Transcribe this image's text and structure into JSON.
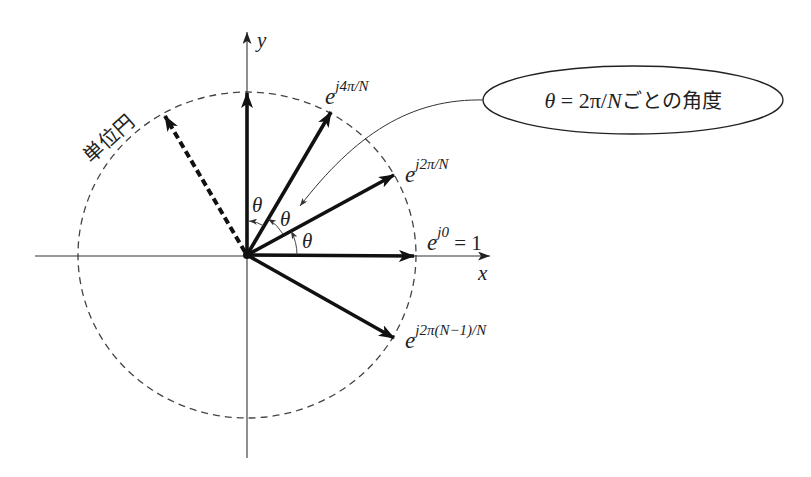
{
  "diagram": {
    "axes": {
      "x_label": "x",
      "y_label": "y"
    },
    "unit_circle_label": "単位円",
    "vectors": [
      {
        "name": "e-j0",
        "base": "e",
        "exponent": "j0",
        "suffix": " = 1",
        "angle_deg": 0
      },
      {
        "name": "e-j2pi-over-N",
        "base": "e",
        "exponent": "j2π/N",
        "angle_deg": 30
      },
      {
        "name": "e-j4pi-over-N",
        "base": "e",
        "exponent": "j4π/N",
        "angle_deg": 60
      },
      {
        "name": "e-j2pi-N-minus-1-over-N",
        "base": "e",
        "exponent": "j2π(N−1)/N",
        "angle_deg": -30
      }
    ],
    "angle_labels": [
      "θ",
      "θ",
      "θ"
    ],
    "callout": {
      "theta": "θ",
      "equals": " = 2π/",
      "n": "N",
      "rest": "ごとの角度"
    },
    "colors": {
      "ink": "#111111",
      "circle": "#444444",
      "background": "#ffffff"
    }
  }
}
